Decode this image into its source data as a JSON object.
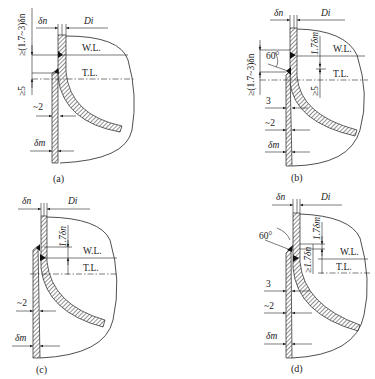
{
  "figure": {
    "panels": [
      {
        "id": "a",
        "caption": "(a)",
        "labels": {
          "shell_thickness": "δn",
          "inner_diameter": "Di",
          "weld_line": "W.L.",
          "tangent_line": "T.L.",
          "overlap": "≥(1.7~3)δn",
          "min_gap": "≥5",
          "offset": "~2",
          "min_thickness": "δm"
        }
      },
      {
        "id": "b",
        "caption": "(b)",
        "labels": {
          "shell_thickness": "δn",
          "inner_diameter": "Di",
          "weld_line": "W.L.",
          "tangent_line": "T.L.",
          "overlap": "≥(1.7~3)δn",
          "bevel_angle": "60°",
          "straight_flange": "1.7δm",
          "min_gap": "≥5",
          "root_gap": "3",
          "offset": "~2",
          "min_thickness": "δm"
        }
      },
      {
        "id": "c",
        "caption": "(c)",
        "labels": {
          "shell_thickness": "δn",
          "inner_diameter": "Di",
          "weld_line": "W.L.",
          "tangent_line": "T.L.",
          "straight_flange": "1.7δn",
          "offset": "~2",
          "min_thickness": "δm"
        }
      },
      {
        "id": "d",
        "caption": "(d)",
        "labels": {
          "shell_thickness": "δn",
          "inner_diameter": "Di",
          "weld_line": "W.L.",
          "tangent_line": "T.L.",
          "bevel_angle": "60°",
          "straight_flange": "1.7δm",
          "min_overlap": "≥1.7δn",
          "root_gap": "3",
          "offset": "~2",
          "min_thickness": "δm"
        }
      }
    ]
  }
}
